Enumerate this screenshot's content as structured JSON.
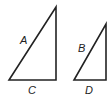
{
  "diagram": {
    "type": "similar-right-triangles",
    "stroke_color": "#222222",
    "triangles": [
      {
        "id": "large",
        "points": [
          [
            9,
            80
          ],
          [
            56,
            80
          ],
          [
            56,
            7
          ]
        ],
        "hypotenuse_label": "A",
        "base_label": "C"
      },
      {
        "id": "small",
        "points": [
          [
            74,
            80
          ],
          [
            106,
            80
          ],
          [
            106,
            24
          ]
        ],
        "hypotenuse_label": "B",
        "base_label": "D"
      }
    ]
  }
}
